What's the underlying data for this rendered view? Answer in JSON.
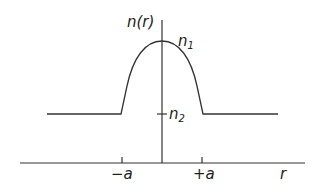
{
  "diagram": {
    "type": "refractive-index-profile",
    "y_axis_label": "n(r)",
    "x_axis_label": "r",
    "peak_label": "n1",
    "peak_label_main": "n",
    "peak_label_sub": "1",
    "cladding_label": "n2",
    "cladding_label_main": "n",
    "cladding_label_sub": "2",
    "left_tick_label": "−a",
    "right_tick_label": "+a",
    "line_color": "#333333"
  }
}
